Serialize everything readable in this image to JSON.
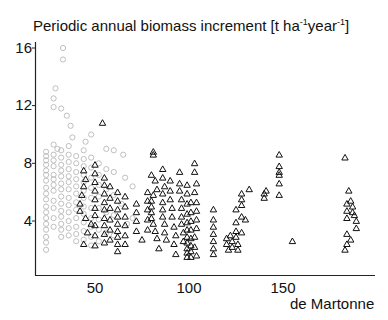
{
  "chart_data": {
    "type": "scatter",
    "title": "Periodic annual biomass increment [t ha-1year-1]",
    "title_parts": {
      "main": "Periodic annual biomass increment [t ha",
      "sup1": "-1",
      "mid": "year",
      "sup2": "-1",
      "end": "]"
    },
    "xlabel": "de Martonne",
    "ylabel": "",
    "xlim": [
      18,
      199
    ],
    "ylim": [
      0.3,
      16.5
    ],
    "xticks": [
      50,
      100,
      150
    ],
    "yticks": [
      4,
      8,
      12,
      16
    ],
    "grid": false,
    "legend": null,
    "series": [
      {
        "name": "circles",
        "marker": "circle",
        "color": "#b8b8b8",
        "points": [
          [
            33,
            16.0
          ],
          [
            33,
            15.2
          ],
          [
            29,
            13.2
          ],
          [
            28,
            12.5
          ],
          [
            28,
            11.9
          ],
          [
            32,
            11.8
          ],
          [
            35,
            11.3
          ],
          [
            37,
            10.6
          ],
          [
            38,
            9.8
          ],
          [
            48,
            10.0
          ],
          [
            45,
            9.5
          ],
          [
            28,
            9.3
          ],
          [
            30,
            9.0
          ],
          [
            24,
            8.8
          ],
          [
            24,
            8.5
          ],
          [
            24,
            8.2
          ],
          [
            24,
            7.9
          ],
          [
            24,
            7.5
          ],
          [
            24,
            7.2
          ],
          [
            24,
            6.8
          ],
          [
            24,
            6.3
          ],
          [
            24,
            5.9
          ],
          [
            24,
            5.5
          ],
          [
            24,
            5.0
          ],
          [
            24,
            4.6
          ],
          [
            24,
            4.2
          ],
          [
            24,
            3.8
          ],
          [
            24,
            3.4
          ],
          [
            24,
            2.9
          ],
          [
            24,
            2.5
          ],
          [
            24,
            2.0
          ],
          [
            28,
            8.6
          ],
          [
            28,
            8.2
          ],
          [
            28,
            7.8
          ],
          [
            28,
            7.2
          ],
          [
            28,
            6.9
          ],
          [
            28,
            6.5
          ],
          [
            28,
            6.1
          ],
          [
            28,
            5.4
          ],
          [
            28,
            4.9
          ],
          [
            28,
            4.2
          ],
          [
            28,
            3.6
          ],
          [
            32,
            8.9
          ],
          [
            32,
            8.4
          ],
          [
            32,
            7.9
          ],
          [
            32,
            7.5
          ],
          [
            32,
            7.1
          ],
          [
            32,
            6.6
          ],
          [
            32,
            6.2
          ],
          [
            32,
            5.7
          ],
          [
            32,
            5.2
          ],
          [
            32,
            4.7
          ],
          [
            32,
            4.3
          ],
          [
            32,
            3.8
          ],
          [
            32,
            3.4
          ],
          [
            32,
            2.9
          ],
          [
            36,
            9.2
          ],
          [
            36,
            8.6
          ],
          [
            36,
            8.1
          ],
          [
            36,
            7.6
          ],
          [
            36,
            7.1
          ],
          [
            36,
            6.7
          ],
          [
            36,
            6.2
          ],
          [
            36,
            5.6
          ],
          [
            36,
            5.1
          ],
          [
            36,
            4.6
          ],
          [
            36,
            4.0
          ],
          [
            36,
            3.5
          ],
          [
            36,
            3.0
          ],
          [
            40,
            8.5
          ],
          [
            40,
            8.0
          ],
          [
            40,
            7.4
          ],
          [
            40,
            6.9
          ],
          [
            40,
            6.4
          ],
          [
            40,
            5.9
          ],
          [
            40,
            5.3
          ],
          [
            40,
            4.8
          ],
          [
            40,
            4.2
          ],
          [
            40,
            3.6
          ],
          [
            40,
            3.1
          ],
          [
            40,
            2.6
          ],
          [
            44,
            8.9
          ],
          [
            44,
            8.3
          ],
          [
            44,
            7.8
          ],
          [
            44,
            7.2
          ],
          [
            44,
            6.7
          ],
          [
            44,
            6.1
          ],
          [
            44,
            5.6
          ],
          [
            44,
            5.0
          ],
          [
            44,
            4.5
          ],
          [
            44,
            3.9
          ],
          [
            44,
            3.3
          ],
          [
            44,
            2.7
          ],
          [
            48,
            8.4
          ],
          [
            48,
            7.7
          ],
          [
            48,
            7.0
          ],
          [
            48,
            6.3
          ],
          [
            48,
            5.6
          ],
          [
            48,
            4.9
          ],
          [
            48,
            4.2
          ],
          [
            48,
            3.6
          ],
          [
            48,
            2.9
          ],
          [
            48,
            2.3
          ],
          [
            52,
            8.0
          ],
          [
            52,
            7.2
          ],
          [
            52,
            6.5
          ],
          [
            52,
            5.7
          ],
          [
            52,
            4.9
          ],
          [
            52,
            4.1
          ],
          [
            52,
            3.4
          ],
          [
            52,
            2.6
          ],
          [
            56,
            9.0
          ],
          [
            56,
            7.6
          ],
          [
            56,
            6.2
          ],
          [
            56,
            4.6
          ],
          [
            56,
            3.2
          ],
          [
            60,
            8.9
          ],
          [
            60,
            7.4
          ],
          [
            60,
            5.8
          ],
          [
            60,
            4.4
          ],
          [
            60,
            3.0
          ],
          [
            65,
            8.6
          ],
          [
            66,
            7.0
          ],
          [
            64,
            5.2
          ],
          [
            67,
            3.8
          ],
          [
            70,
            6.4
          ],
          [
            70,
            4.2
          ]
        ]
      },
      {
        "name": "triangles",
        "marker": "triangle",
        "color": "#111111",
        "points": [
          [
            54,
            10.8
          ],
          [
            44,
            7.5
          ],
          [
            45,
            6.9
          ],
          [
            44,
            6.4
          ],
          [
            43,
            5.8
          ],
          [
            42,
            5.2
          ],
          [
            42,
            4.7
          ],
          [
            45,
            4.2
          ],
          [
            48,
            3.8
          ],
          [
            46,
            3.2
          ],
          [
            44,
            2.4
          ],
          [
            50,
            7.9
          ],
          [
            50,
            7.3
          ],
          [
            50,
            6.7
          ],
          [
            50,
            6.1
          ],
          [
            50,
            5.5
          ],
          [
            50,
            4.9
          ],
          [
            50,
            4.4
          ],
          [
            50,
            3.7
          ],
          [
            50,
            3.0
          ],
          [
            50,
            2.3
          ],
          [
            55,
            7.0
          ],
          [
            55,
            6.5
          ],
          [
            55,
            5.9
          ],
          [
            55,
            5.3
          ],
          [
            55,
            4.8
          ],
          [
            55,
            4.2
          ],
          [
            55,
            3.7
          ],
          [
            55,
            3.1
          ],
          [
            55,
            2.5
          ],
          [
            58,
            6.4
          ],
          [
            58,
            5.6
          ],
          [
            58,
            4.9
          ],
          [
            58,
            4.1
          ],
          [
            58,
            3.4
          ],
          [
            58,
            2.7
          ],
          [
            62,
            6.0
          ],
          [
            62,
            5.4
          ],
          [
            62,
            4.8
          ],
          [
            62,
            4.3
          ],
          [
            62,
            3.8
          ],
          [
            62,
            3.3
          ],
          [
            62,
            2.9
          ],
          [
            62,
            2.4
          ],
          [
            62,
            1.9
          ],
          [
            66,
            5.7
          ],
          [
            66,
            5.0
          ],
          [
            66,
            4.3
          ],
          [
            66,
            3.7
          ],
          [
            66,
            3.0
          ],
          [
            66,
            2.4
          ],
          [
            72,
            5.2
          ],
          [
            72,
            4.6
          ],
          [
            72,
            4.0
          ],
          [
            72,
            3.3
          ],
          [
            75,
            2.7
          ],
          [
            78,
            6.0
          ],
          [
            78,
            5.4
          ],
          [
            78,
            4.8
          ],
          [
            78,
            4.1
          ],
          [
            78,
            3.4
          ],
          [
            81,
            8.8
          ],
          [
            81,
            8.6
          ],
          [
            80,
            7.2
          ],
          [
            82,
            6.8
          ],
          [
            83,
            6.2
          ],
          [
            81,
            5.8
          ],
          [
            80,
            5.4
          ],
          [
            80,
            5.0
          ],
          [
            80,
            4.6
          ],
          [
            80,
            4.2
          ],
          [
            81,
            3.8
          ],
          [
            82,
            3.3
          ],
          [
            83,
            2.8
          ],
          [
            84,
            2.1
          ],
          [
            86,
            7.6
          ],
          [
            86,
            7.0
          ],
          [
            87,
            6.4
          ],
          [
            86,
            5.9
          ],
          [
            86,
            5.3
          ],
          [
            86,
            4.8
          ],
          [
            86,
            4.3
          ],
          [
            87,
            3.8
          ],
          [
            87,
            3.2
          ],
          [
            88,
            2.7
          ],
          [
            90,
            6.8
          ],
          [
            90,
            6.1
          ],
          [
            90,
            5.5
          ],
          [
            91,
            4.9
          ],
          [
            91,
            4.3
          ],
          [
            92,
            3.6
          ],
          [
            93,
            3.0
          ],
          [
            92,
            2.4
          ],
          [
            93,
            1.7
          ],
          [
            95,
            7.4
          ],
          [
            95,
            6.6
          ],
          [
            95,
            6.1
          ],
          [
            96,
            5.5
          ],
          [
            96,
            4.9
          ],
          [
            96,
            4.3
          ],
          [
            96,
            3.8
          ],
          [
            97,
            3.2
          ],
          [
            97,
            2.6
          ],
          [
            99,
            6.5
          ],
          [
            99,
            5.9
          ],
          [
            99,
            5.2
          ],
          [
            99,
            4.5
          ],
          [
            99,
            3.9
          ],
          [
            99,
            3.4
          ],
          [
            99,
            2.9
          ],
          [
            99,
            2.5
          ],
          [
            99,
            2.1
          ],
          [
            99,
            1.8
          ],
          [
            99,
            1.5
          ],
          [
            101,
            5.3
          ],
          [
            101,
            4.6
          ],
          [
            101,
            4.0
          ],
          [
            101,
            3.4
          ],
          [
            101,
            2.8
          ],
          [
            101,
            2.3
          ],
          [
            101,
            1.9
          ],
          [
            101,
            1.5
          ],
          [
            103,
            8.0
          ],
          [
            103,
            7.4
          ],
          [
            104,
            6.6
          ],
          [
            103,
            6.0
          ],
          [
            104,
            5.3
          ],
          [
            104,
            4.7
          ],
          [
            104,
            4.1
          ],
          [
            104,
            3.5
          ],
          [
            103,
            2.9
          ],
          [
            103,
            2.2
          ],
          [
            104,
            1.6
          ],
          [
            113,
            4.8
          ],
          [
            113,
            4.1
          ],
          [
            113,
            3.6
          ],
          [
            113,
            3.1
          ],
          [
            113,
            2.6
          ],
          [
            113,
            2.1
          ],
          [
            113,
            1.7
          ],
          [
            120,
            2.8
          ],
          [
            120,
            2.4
          ],
          [
            121,
            2.0
          ],
          [
            122,
            3.0
          ],
          [
            123,
            2.6
          ],
          [
            123,
            2.2
          ],
          [
            125,
            4.8
          ],
          [
            125,
            3.9
          ],
          [
            125,
            3.3
          ],
          [
            125,
            2.9
          ],
          [
            126,
            2.4
          ],
          [
            126,
            2.0
          ],
          [
            128,
            5.9
          ],
          [
            128,
            5.5
          ],
          [
            128,
            5.1
          ],
          [
            128,
            4.3
          ],
          [
            128,
            3.2
          ],
          [
            130,
            4.1
          ],
          [
            132,
            6.2
          ],
          [
            140,
            5.9
          ],
          [
            140,
            5.6
          ],
          [
            141,
            6.1
          ],
          [
            148,
            8.6
          ],
          [
            148,
            7.8
          ],
          [
            148,
            7.4
          ],
          [
            148,
            7.2
          ],
          [
            148,
            6.6
          ],
          [
            148,
            5.8
          ],
          [
            155,
            2.6
          ],
          [
            183,
            8.4
          ],
          [
            185,
            6.1
          ],
          [
            184,
            5.2
          ],
          [
            184,
            4.7
          ],
          [
            184,
            4.2
          ],
          [
            184,
            3.1
          ],
          [
            183,
            2.0
          ],
          [
            184,
            2.4
          ],
          [
            186,
            5.4
          ],
          [
            187,
            5.0
          ],
          [
            187,
            4.6
          ],
          [
            188,
            4.4
          ],
          [
            189,
            4.0
          ],
          [
            189,
            3.5
          ],
          [
            186,
            2.7
          ]
        ]
      }
    ]
  },
  "labels": {
    "title_main": "Periodic annual biomass increment [t ha",
    "title_sup1": "-1",
    "title_mid": "year",
    "title_sup2": "-1",
    "title_end": "]",
    "xlabel": "de Martonne",
    "yticks": [
      "16",
      "12",
      "8",
      "4"
    ],
    "xticks": [
      "50",
      "100",
      "150"
    ]
  }
}
